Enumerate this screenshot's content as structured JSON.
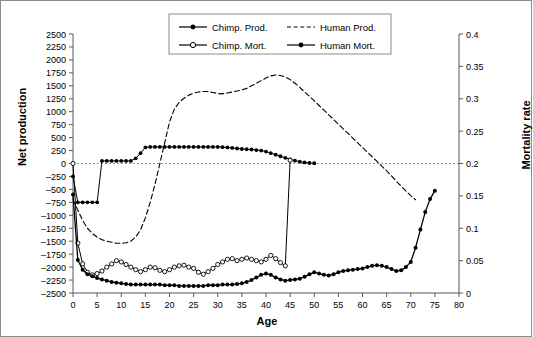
{
  "chart_data": {
    "type": "line",
    "title": "",
    "xlabel": "Age",
    "ylabel": "Net production",
    "y2label": "Mortality rate",
    "xlim": [
      0,
      80
    ],
    "ylim": [
      -2500,
      2500
    ],
    "y2lim": [
      0,
      0.4
    ],
    "grid": false,
    "legend_position": "top-center",
    "xticks": [
      0,
      5,
      10,
      15,
      20,
      25,
      30,
      35,
      40,
      45,
      50,
      55,
      60,
      65,
      70,
      75,
      80
    ],
    "yticks": [
      -2500,
      -2250,
      -2000,
      -1750,
      -1500,
      -1250,
      -1000,
      -750,
      -500,
      -250,
      0,
      250,
      500,
      750,
      1000,
      1250,
      1500,
      1750,
      2000,
      2250,
      2500
    ],
    "y2ticks": [
      0,
      0.05,
      0.1,
      0.15,
      0.2,
      0.25,
      0.3,
      0.35,
      0.4
    ],
    "zero_reference_line": 0,
    "series": [
      {
        "name": "Chimp. Prod.",
        "axis": "left",
        "style": "solid-filled-markers",
        "x": [
          0,
          1,
          2,
          3,
          4,
          5,
          6,
          7,
          8,
          9,
          10,
          11,
          12,
          13,
          14,
          15,
          16,
          17,
          18,
          19,
          20,
          21,
          22,
          23,
          24,
          25,
          26,
          27,
          28,
          29,
          30,
          31,
          32,
          33,
          34,
          35,
          36,
          37,
          38,
          39,
          40,
          41,
          42,
          43,
          44,
          45,
          46,
          47,
          48,
          49,
          50
        ],
        "values": [
          -250,
          -750,
          -750,
          -750,
          -750,
          -750,
          50,
          50,
          50,
          50,
          50,
          50,
          50,
          100,
          200,
          310,
          320,
          320,
          320,
          320,
          320,
          320,
          320,
          320,
          320,
          320,
          320,
          320,
          320,
          320,
          320,
          315,
          310,
          300,
          290,
          280,
          275,
          270,
          260,
          250,
          230,
          200,
          170,
          140,
          110,
          80,
          55,
          35,
          20,
          10,
          5
        ]
      },
      {
        "name": "Human Prod.",
        "axis": "left",
        "style": "dashed",
        "x": [
          0,
          1,
          2,
          3,
          4,
          5,
          6,
          7,
          8,
          9,
          10,
          11,
          12,
          13,
          14,
          15,
          16,
          17,
          18,
          19,
          20,
          21,
          22,
          23,
          24,
          25,
          26,
          27,
          28,
          29,
          30,
          31,
          32,
          33,
          34,
          35,
          36,
          37,
          38,
          39,
          40,
          41,
          42,
          43,
          44,
          45,
          46,
          47,
          48,
          49,
          50,
          51,
          52,
          53,
          54,
          55,
          56,
          57,
          58,
          59,
          60,
          61,
          62,
          63,
          64,
          65,
          66,
          67,
          68,
          69,
          70,
          71
        ],
        "values": [
          -700,
          -900,
          -1100,
          -1250,
          -1350,
          -1420,
          -1470,
          -1500,
          -1520,
          -1540,
          -1540,
          -1530,
          -1500,
          -1420,
          -1280,
          -1050,
          -750,
          -400,
          0,
          400,
          800,
          1050,
          1180,
          1260,
          1320,
          1360,
          1380,
          1390,
          1390,
          1370,
          1350,
          1345,
          1360,
          1380,
          1400,
          1420,
          1450,
          1500,
          1550,
          1600,
          1650,
          1690,
          1710,
          1700,
          1670,
          1620,
          1550,
          1470,
          1380,
          1300,
          1210,
          1120,
          1030,
          940,
          850,
          760,
          670,
          580,
          490,
          400,
          310,
          220,
          130,
          40,
          -50,
          -140,
          -240,
          -340,
          -440,
          -530,
          -620,
          -700
        ]
      },
      {
        "name": "Chimp. Mort.",
        "axis": "right",
        "style": "solid-open-markers",
        "x": [
          0,
          1,
          2,
          3,
          4,
          5,
          6,
          7,
          8,
          9,
          10,
          11,
          12,
          13,
          14,
          15,
          16,
          17,
          18,
          19,
          20,
          21,
          22,
          23,
          24,
          25,
          26,
          27,
          28,
          29,
          30,
          31,
          32,
          33,
          34,
          35,
          36,
          37,
          38,
          39,
          40,
          41,
          42,
          43,
          44,
          45
        ],
        "values": [
          0.2,
          0.077,
          0.045,
          0.032,
          0.028,
          0.03,
          0.034,
          0.04,
          0.045,
          0.05,
          0.048,
          0.044,
          0.04,
          0.036,
          0.033,
          0.036,
          0.04,
          0.039,
          0.035,
          0.033,
          0.036,
          0.04,
          0.042,
          0.043,
          0.04,
          0.038,
          0.032,
          0.029,
          0.033,
          0.038,
          0.044,
          0.048,
          0.052,
          0.053,
          0.05,
          0.052,
          0.054,
          0.052,
          0.05,
          0.048,
          0.052,
          0.058,
          0.053,
          0.047,
          0.042,
          0.205
        ]
      },
      {
        "name": "Human Mort.",
        "axis": "right",
        "style": "solid-filled-markers-thick",
        "x": [
          0,
          1,
          2,
          3,
          4,
          5,
          6,
          7,
          8,
          9,
          10,
          11,
          12,
          13,
          14,
          15,
          16,
          17,
          18,
          19,
          20,
          21,
          22,
          23,
          24,
          25,
          26,
          27,
          28,
          29,
          30,
          31,
          32,
          33,
          34,
          35,
          36,
          37,
          38,
          39,
          40,
          41,
          42,
          43,
          44,
          45,
          46,
          47,
          48,
          49,
          50,
          51,
          52,
          53,
          54,
          55,
          56,
          57,
          58,
          59,
          60,
          61,
          62,
          63,
          64,
          65,
          66,
          67,
          68,
          69,
          70,
          71,
          72,
          73,
          74,
          75
        ],
        "values": [
          0.152,
          0.051,
          0.036,
          0.029,
          0.026,
          0.023,
          0.021,
          0.019,
          0.017,
          0.016,
          0.015,
          0.014,
          0.013,
          0.013,
          0.013,
          0.013,
          0.013,
          0.013,
          0.013,
          0.012,
          0.012,
          0.012,
          0.011,
          0.011,
          0.011,
          0.011,
          0.011,
          0.011,
          0.012,
          0.012,
          0.012,
          0.013,
          0.013,
          0.013,
          0.014,
          0.015,
          0.017,
          0.02,
          0.024,
          0.028,
          0.03,
          0.028,
          0.024,
          0.021,
          0.019,
          0.02,
          0.021,
          0.022,
          0.025,
          0.029,
          0.032,
          0.03,
          0.028,
          0.027,
          0.029,
          0.032,
          0.034,
          0.035,
          0.036,
          0.037,
          0.038,
          0.04,
          0.042,
          0.043,
          0.042,
          0.04,
          0.037,
          0.034,
          0.035,
          0.04,
          0.048,
          0.07,
          0.098,
          0.125,
          0.145,
          0.158
        ]
      }
    ]
  },
  "legend": {
    "entries": [
      {
        "label": "Chimp. Prod.",
        "marker": "filled-circle",
        "line": "solid"
      },
      {
        "label": "Human Prod.",
        "marker": "none",
        "line": "dashed"
      },
      {
        "label": "Chimp. Mort.",
        "marker": "open-circle",
        "line": "solid"
      },
      {
        "label": "Human Mort.",
        "marker": "filled-circle",
        "line": "solid"
      }
    ]
  },
  "colors": {
    "ink": "#000000",
    "axis": "#595959",
    "frame": "#8c8c8c",
    "background": "#ffffff"
  }
}
